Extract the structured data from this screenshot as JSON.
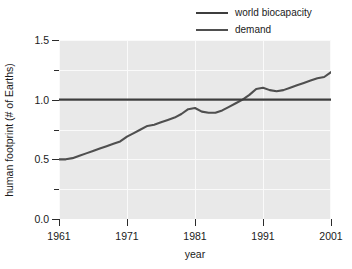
{
  "chart_data": {
    "type": "line",
    "title": "",
    "xlabel": "year",
    "ylabel": "human footprint (# of Earths)",
    "xlim": [
      1961,
      2001
    ],
    "ylim": [
      0.0,
      1.5
    ],
    "grid": true,
    "legend_position": "top-right",
    "xticks": [
      "1961",
      "1971",
      "1981",
      "1991",
      "2001"
    ],
    "xtick_values": [
      1961,
      1971,
      1981,
      1991,
      2001
    ],
    "yticks": [
      "0.0",
      "0.5",
      "1.0",
      "1.5"
    ],
    "ytick_values": [
      0.0,
      0.5,
      1.0,
      1.5
    ],
    "ytick_minor_values": [
      0.25,
      0.75,
      1.25
    ],
    "colors": {
      "biocapacity_line": "#3d3d3d",
      "demand_line": "#4f4f4f",
      "plot_background": "#e9e9e9",
      "gridline": "#fafafa",
      "text": "#1a1a1a",
      "figure_background": "#ffffff"
    },
    "series": [
      {
        "name": "world biocapacity",
        "color": "#3d3d3d",
        "x": [
          1961,
          2001
        ],
        "values": [
          1.0,
          1.0
        ]
      },
      {
        "name": "demand",
        "color": "#4f4f4f",
        "x": [
          1961,
          1962,
          1963,
          1964,
          1965,
          1966,
          1967,
          1968,
          1969,
          1970,
          1971,
          1972,
          1973,
          1974,
          1975,
          1976,
          1977,
          1978,
          1979,
          1980,
          1981,
          1982,
          1983,
          1984,
          1985,
          1986,
          1987,
          1988,
          1989,
          1990,
          1991,
          1992,
          1993,
          1994,
          1995,
          1996,
          1997,
          1998,
          1999,
          2000,
          2001
        ],
        "values": [
          0.5,
          0.5,
          0.51,
          0.53,
          0.55,
          0.57,
          0.59,
          0.61,
          0.63,
          0.65,
          0.69,
          0.72,
          0.75,
          0.78,
          0.79,
          0.81,
          0.83,
          0.85,
          0.88,
          0.92,
          0.93,
          0.9,
          0.89,
          0.89,
          0.91,
          0.94,
          0.97,
          1.0,
          1.04,
          1.09,
          1.1,
          1.08,
          1.07,
          1.08,
          1.1,
          1.12,
          1.14,
          1.16,
          1.18,
          1.19,
          1.23
        ]
      }
    ]
  },
  "legend": {
    "items": [
      {
        "label": "world biocapacity",
        "color": "#3d3d3d"
      },
      {
        "label": "demand",
        "color": "#4f4f4f"
      }
    ]
  },
  "axes": {
    "x_title": "year",
    "y_title": "human footprint (# of Earths)"
  }
}
